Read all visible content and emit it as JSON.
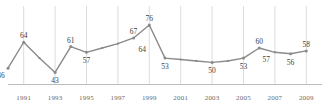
{
  "chart_data": {
    "type": "line",
    "title": "",
    "subtitle": "",
    "xlabel": "",
    "ylabel": "",
    "grid": "vertical-only",
    "legend": "none",
    "xlim": [
      1990,
      2010
    ],
    "ylim": [
      35,
      85
    ],
    "x": [
      1990,
      1991,
      1992,
      1993,
      1994,
      1995,
      1996,
      1997,
      1998,
      1999,
      2000,
      2001,
      2002,
      2003,
      2004,
      2005,
      2006,
      2007,
      2008,
      2009
    ],
    "series": [
      {
        "name": "value",
        "values": [
          46,
          64,
          53,
          43,
          61,
          57,
          60,
          63,
          67,
          76,
          53,
          52,
          51,
          50,
          51,
          53,
          60,
          57,
          56,
          58
        ]
      }
    ],
    "point_labels": [
      {
        "x": 1990,
        "value": 46,
        "text": "46",
        "position": "below-left"
      },
      {
        "x": 1991,
        "value": 64,
        "text": "64",
        "position": "above"
      },
      {
        "x": 1993,
        "value": 43,
        "text": "43",
        "position": "below"
      },
      {
        "x": 1994,
        "value": 61,
        "text": "61",
        "position": "above"
      },
      {
        "x": 1995,
        "value": 57,
        "text": "57",
        "position": "below"
      },
      {
        "x": 1998,
        "value": 67,
        "text": "67",
        "position": "above"
      },
      {
        "x": 1999,
        "value": 76,
        "text": "76",
        "position": "above"
      },
      {
        "x": 1999,
        "value": 64,
        "text": "64",
        "position": "below-left"
      },
      {
        "x": 2000,
        "value": 53,
        "text": "53",
        "position": "below"
      },
      {
        "x": 2003,
        "value": 50,
        "text": "50",
        "position": "below"
      },
      {
        "x": 2005,
        "value": 53,
        "text": "53",
        "position": "below"
      },
      {
        "x": 2006,
        "value": 60,
        "text": "60",
        "position": "above"
      },
      {
        "x": 2006,
        "value": 57,
        "text": "57",
        "position": "below-right"
      },
      {
        "x": 2008,
        "value": 56,
        "text": "56",
        "position": "below"
      },
      {
        "x": 2009,
        "value": 58,
        "text": "58",
        "position": "above"
      }
    ],
    "xticks": [
      {
        "x": 1991,
        "label": "1991"
      },
      {
        "x": 1993,
        "label": "1993"
      },
      {
        "x": 1995,
        "label": "1995"
      },
      {
        "x": 1997,
        "label": "1997"
      },
      {
        "x": 1999,
        "label": "1999"
      },
      {
        "x": 2001,
        "label": "2001"
      },
      {
        "x": 2003,
        "label": "2003"
      },
      {
        "x": 2005,
        "label": "2005"
      },
      {
        "x": 2007,
        "label": "2007"
      },
      {
        "x": 2009,
        "label": "2009"
      }
    ],
    "colors": {
      "line": "#8a8a8a",
      "marker": "#8a8a8a",
      "grid": "#dcdcdc",
      "axis": "#bdbdbd",
      "label_text": "#404040",
      "tick_text": "#6a6a6a",
      "background": "#ffffff"
    }
  }
}
